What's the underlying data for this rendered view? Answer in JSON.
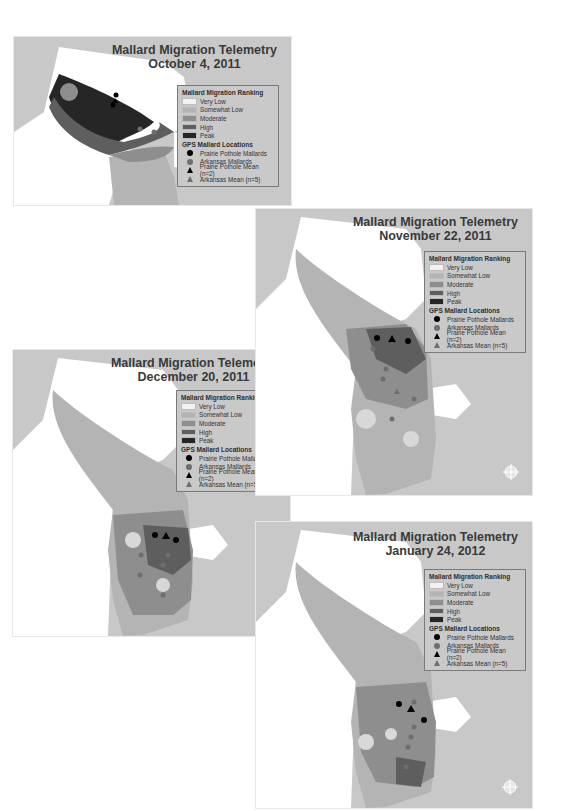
{
  "figure": {
    "panels": [
      {
        "id": "oct",
        "title_line1": "Mallard Migration Telemetry",
        "title_line2": "October 4, 2011"
      },
      {
        "id": "nov",
        "title_line1": "Mallard Migration Telemetry",
        "title_line2": "November 22, 2011"
      },
      {
        "id": "dec",
        "title_line1": "Mallard Migration Telemetry",
        "title_line2": "December 20, 2011"
      },
      {
        "id": "jan",
        "title_line1": "Mallard Migration Telemetry",
        "title_line2": "January 24, 2012"
      }
    ],
    "legend": {
      "ranking_header": "Mallard Migration Ranking",
      "ranking": [
        {
          "label": "Very Low",
          "color": "#f2f2f2"
        },
        {
          "label": "Somewhat Low",
          "color": "#b4b4b4"
        },
        {
          "label": "Moderate",
          "color": "#8e8e8e"
        },
        {
          "label": "High",
          "color": "#5e5e5e"
        },
        {
          "label": "Peak",
          "color": "#262626"
        }
      ],
      "gps_header": "GPS Mallard Locations",
      "gps": [
        {
          "label": "Prairie Pothole Mallards",
          "symbol": "circle",
          "color": "#000000"
        },
        {
          "label": "Arkansas Mallards",
          "symbol": "circle",
          "color": "#6e6e6e"
        },
        {
          "label": "Prairie Pothole Mean (n=2)",
          "symbol": "triangle",
          "color": "#000000"
        },
        {
          "label": "Arkansas Mean (n=5)",
          "symbol": "triangle",
          "color": "#6e6e6e"
        }
      ]
    },
    "colors": {
      "background": "#c8c8c8",
      "land_outside": "#ffffff",
      "flyway_base": "#b4b4b4"
    }
  }
}
